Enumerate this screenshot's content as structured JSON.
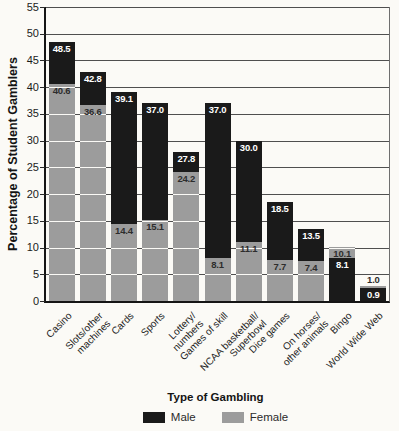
{
  "chart_data": {
    "type": "bar",
    "bar_style": "overlapped",
    "title": "",
    "ylabel": "Percentage of Student Gamblers",
    "xlabel": "Type of Gambling",
    "ylim": [
      0,
      55
    ],
    "yticks": [
      0,
      5,
      10,
      15,
      20,
      25,
      30,
      35,
      40,
      45,
      50,
      55
    ],
    "grid": true,
    "legend_position": "bottom",
    "categories": [
      [
        "Casino"
      ],
      [
        "Slots/other",
        "machines"
      ],
      [
        "Cards"
      ],
      [
        "Sports"
      ],
      [
        "Lottery/",
        "numbers"
      ],
      [
        "Games of skill"
      ],
      [
        "NCAA basketball/",
        "Superbowl"
      ],
      [
        "Dice games"
      ],
      [
        "On horses/",
        "other animals"
      ],
      [
        "Bingo"
      ],
      [
        "World Wide Web"
      ]
    ],
    "series": [
      {
        "name": "Male",
        "color": "#1a1a1a",
        "label_color": "#ffffff",
        "values": [
          48.5,
          42.8,
          39.1,
          37.0,
          27.8,
          37.0,
          30.0,
          18.5,
          13.5,
          8.1,
          0.9
        ]
      },
      {
        "name": "Female",
        "color": "#9c9c9c",
        "label_color": "#2d2d2d",
        "values": [
          40.6,
          36.6,
          14.4,
          15.1,
          24.2,
          8.1,
          11.1,
          7.7,
          7.4,
          10.1,
          1.0
        ]
      }
    ]
  }
}
